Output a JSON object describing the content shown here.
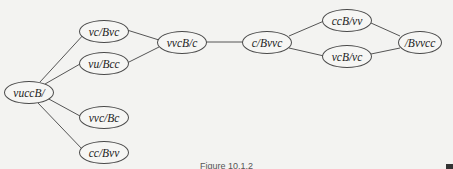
{
  "diagram": {
    "type": "state-graph",
    "nodes": [
      {
        "id": "n0",
        "label": "vuccB/",
        "cx": 29,
        "cy": 92
      },
      {
        "id": "n1",
        "label": "vc/Bvc",
        "cx": 104,
        "cy": 31
      },
      {
        "id": "n2",
        "label": "vu/Bcc",
        "cx": 104,
        "cy": 63
      },
      {
        "id": "n3",
        "label": "vvc/Bc",
        "cx": 104,
        "cy": 117
      },
      {
        "id": "n4",
        "label": "cc/Bvv",
        "cx": 104,
        "cy": 152
      },
      {
        "id": "n5",
        "label": "vvcB/c",
        "cx": 182,
        "cy": 42
      },
      {
        "id": "n6",
        "label": "c/Bvvc",
        "cx": 268,
        "cy": 42
      },
      {
        "id": "n7",
        "label": "ccB/vv",
        "cx": 348,
        "cy": 20
      },
      {
        "id": "n8",
        "label": "vcB/vc",
        "cx": 348,
        "cy": 56
      },
      {
        "id": "n9",
        "label": "/Bvvcc",
        "cx": 419,
        "cy": 42
      }
    ],
    "edges": [
      [
        "n0",
        "n1"
      ],
      [
        "n0",
        "n2"
      ],
      [
        "n0",
        "n3"
      ],
      [
        "n0",
        "n4"
      ],
      [
        "n1",
        "n5"
      ],
      [
        "n2",
        "n5"
      ],
      [
        "n5",
        "n6"
      ],
      [
        "n6",
        "n7"
      ],
      [
        "n6",
        "n8"
      ],
      [
        "n7",
        "n9"
      ],
      [
        "n8",
        "n9"
      ]
    ],
    "caption": "Figure 10.1.2"
  }
}
